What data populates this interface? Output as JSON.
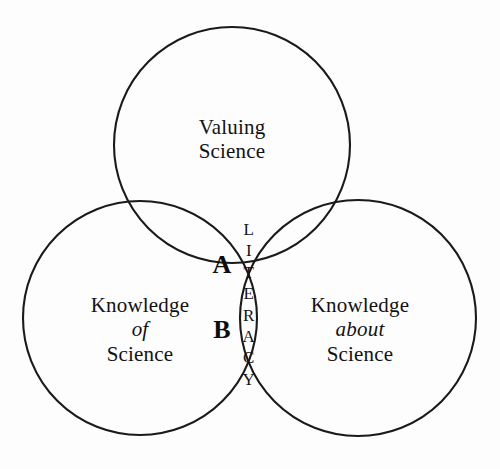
{
  "diagram": {
    "type": "venn",
    "background_color": "#fdfdfd",
    "stroke_color": "#1a1a1a",
    "text_color": "#121212",
    "circles": [
      {
        "id": "valuing-science",
        "position": "top",
        "cx": 232,
        "cy": 145,
        "r": 118,
        "label_lines": [
          "Valuing",
          "Science"
        ]
      },
      {
        "id": "knowledge-of-science",
        "position": "bottom-left",
        "cx": 140,
        "cy": 318,
        "r": 117,
        "label_lines": [
          "Knowledge",
          "of",
          "Science"
        ]
      },
      {
        "id": "knowledge-about-science",
        "position": "bottom-right",
        "cx": 358,
        "cy": 318,
        "r": 118,
        "label_lines": [
          "Knowledge",
          "about",
          "Science"
        ]
      }
    ],
    "labels": {
      "top": {
        "line1": "Valuing",
        "line2": "Science"
      },
      "left": {
        "line1": "Knowledge",
        "line2": "of",
        "line3": "Science"
      },
      "right": {
        "line1": "Knowledge",
        "line2": "about",
        "line3": "Science"
      }
    },
    "regions": {
      "a": {
        "marker": "A",
        "description": "triple overlap of all three circles"
      },
      "b": {
        "marker": "B",
        "description": "overlap of the two lower circles"
      }
    },
    "literacy": {
      "word": "LITERACY",
      "orientation": "vertical",
      "letters": [
        "L",
        "I",
        "T",
        "E",
        "R",
        "A",
        "C",
        "Y"
      ]
    }
  }
}
